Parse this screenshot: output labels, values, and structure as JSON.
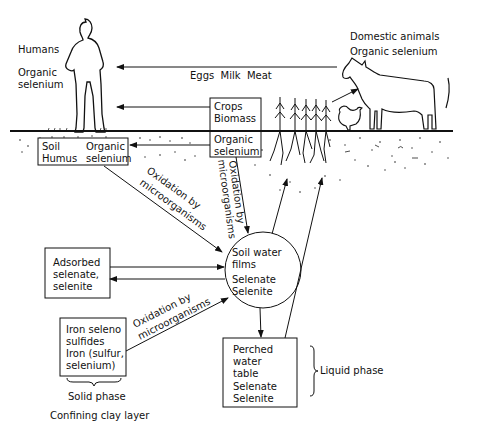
{
  "diagram": {
    "labels": {
      "humans": "Humans",
      "humans_organic_1": "Organic",
      "humans_organic_2": "selenium",
      "animals_1": "Domestic animals",
      "animals_2": "Organic selenium",
      "food_flow": "Eggs  Milk  Meat",
      "crops_1": "Crops",
      "crops_2": "Biomass",
      "organic_se_1": "Organic",
      "organic_se_2": "selenium",
      "soil_humus_1": "Soil",
      "soil_humus_2": "Humus",
      "soil_humus_3": "Organic",
      "soil_humus_4": "selenium",
      "oxidation_1a": "Oxidation by",
      "oxidation_1b": "microorganisms",
      "oxidation_2a": "Oxidation by",
      "oxidation_2b": "microorganisms",
      "oxidation_3a": "Oxidation by",
      "oxidation_3b": "microorganisms",
      "soil_water_1": "Soil water",
      "soil_water_2": "films",
      "soil_water_3": "Selenate",
      "soil_water_4": "Selenite",
      "adsorbed_1": "Adsorbed",
      "adsorbed_2": "selenate,",
      "adsorbed_3": "selenite",
      "iron_1": "Iron seleno",
      "iron_2": "sulfides",
      "iron_3": "Iron (sulfur,",
      "iron_4": "selenium)",
      "solid_phase": "Solid phase",
      "confining": "Confining clay layer",
      "perched_1": "Perched",
      "perched_2": "water",
      "perched_3": "table",
      "perched_4": "Selenate",
      "perched_5": "Selenite",
      "liquid_phase": "Liquid phase"
    },
    "nodes": [
      {
        "id": "humans",
        "label": "Humans — Organic selenium"
      },
      {
        "id": "animals",
        "label": "Domestic animals — Organic selenium"
      },
      {
        "id": "crops",
        "label": "Crops Biomass"
      },
      {
        "id": "plant-organic",
        "label": "Organic selenium"
      },
      {
        "id": "soil-humus",
        "label": "Soil Humus Organic selenium"
      },
      {
        "id": "soil-water",
        "label": "Soil water films Selenate Selenite"
      },
      {
        "id": "adsorbed",
        "label": "Adsorbed selenate, selenite"
      },
      {
        "id": "iron",
        "label": "Iron seleno sulfides Iron (sulfur, selenium)"
      },
      {
        "id": "perched",
        "label": "Perched water table Selenate Selenite"
      }
    ],
    "edges": [
      {
        "from": "animals",
        "to": "humans",
        "label": "Eggs Milk Meat"
      },
      {
        "from": "crops",
        "to": "humans",
        "label": ""
      },
      {
        "from": "crops",
        "to": "animals",
        "label": ""
      },
      {
        "from": "plant-organic",
        "to": "soil-humus",
        "label": ""
      },
      {
        "from": "soil-humus",
        "to": "soil-water",
        "label": "Oxidation by microorganisms"
      },
      {
        "from": "plant-organic",
        "to": "soil-water",
        "label": "Oxidation by microorganisms"
      },
      {
        "from": "soil-water",
        "to": "plant-organic",
        "label": ""
      },
      {
        "from": "adsorbed",
        "to": "soil-water",
        "label": ""
      },
      {
        "from": "soil-water",
        "to": "adsorbed",
        "label": ""
      },
      {
        "from": "iron",
        "to": "soil-water",
        "label": "Oxidation by microorganisms"
      },
      {
        "from": "soil-water",
        "to": "perched",
        "label": ""
      },
      {
        "from": "perched",
        "to": "plant-organic",
        "label": ""
      }
    ]
  }
}
